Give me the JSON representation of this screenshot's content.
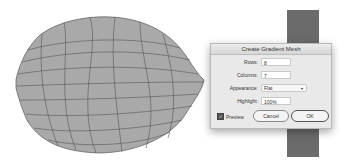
{
  "dialog": {
    "title": "Create Gradient Mesh",
    "fields": [
      {
        "label": "Rows:",
        "value": "8"
      },
      {
        "label": "Columns:",
        "value": "7"
      },
      {
        "label": "Appearance:",
        "value": "Flat"
      },
      {
        "label": "Highlight:",
        "value": "100%"
      }
    ],
    "preview_label": "Preview",
    "preview_checked": true,
    "cancel_label": "Cancel",
    "ok_label": "OK"
  },
  "colors": {
    "shape_fill": "#a9a9a9",
    "mesh_lines": "#555555",
    "swatch": "#6b6b6b"
  }
}
